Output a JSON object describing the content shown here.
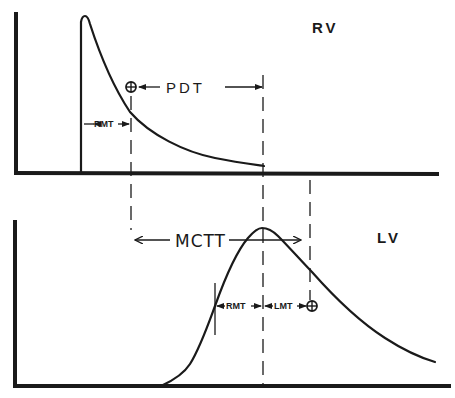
{
  "diagram": {
    "panels": [
      {
        "id": "top",
        "label": "RV",
        "description": "Right ventricle indicator dilution curve (rapid spike and exponential decay)"
      },
      {
        "id": "bottom",
        "label": "LV",
        "description": "Left ventricle indicator dilution curve (delayed rise, peak, decay)"
      }
    ],
    "labels": {
      "rv": "RV",
      "lv": "LV",
      "pdt": "PDT",
      "mctt": "MCTT",
      "rmt_top": "RMT",
      "rmt_bottom": "RMT",
      "lmt": "LMT"
    },
    "markers": {
      "mean_time_symbol": "circled-plus"
    },
    "colors": {
      "ink": "#1a1a1a",
      "background": "#ffffff"
    }
  }
}
